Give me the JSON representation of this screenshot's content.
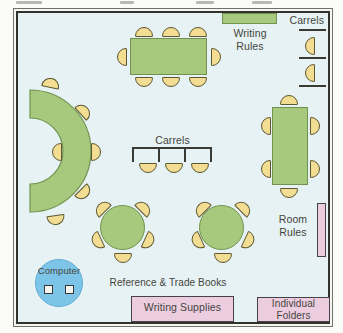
{
  "labels": {
    "carrels_wall": "Carrels",
    "carrels_center": "Carrels",
    "writing_rules_line1": "Writing",
    "writing_rules_line2": "Rules",
    "room_rules_line1": "Room",
    "room_rules_line2": "Rules",
    "computer": "Computer",
    "reference_books": "Reference & Trade Books",
    "writing_supplies": "Writing Supplies",
    "individual_folders_line1": "Individual",
    "individual_folders_line2": "Folders"
  },
  "colors": {
    "floor": "#e6f2f4",
    "table_green": "#a6c97d",
    "table_border": "#71934f",
    "chair_fill": "#f2dd92",
    "chair_border": "#5d5733",
    "pink_fill": "#eccde0",
    "computer_blue": "#7cc5e8",
    "wall": "#33332e"
  }
}
